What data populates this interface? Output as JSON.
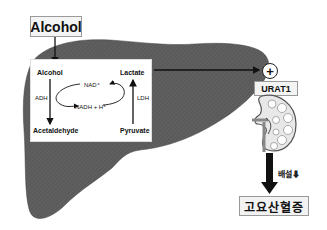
{
  "title": "Alcohol",
  "liver": {
    "color": "#555555",
    "substrates": {
      "alcohol": "Alcohol",
      "acetaldehyde": "Acetaldehyde",
      "lactate": "Lactate",
      "pyruvate": "Pyruvate"
    },
    "enzymes": {
      "adh": "ADH",
      "ldh": "LDH"
    },
    "cofactors": {
      "nad": "NAD⁺",
      "nadh": "NADH + H⁺"
    }
  },
  "kidney": {
    "effect_symbol": "+",
    "transporter": "URAT1"
  },
  "outcome": {
    "excretion_label": "배설",
    "excretion_arrow": "⬇",
    "result": "고요산혈증"
  }
}
